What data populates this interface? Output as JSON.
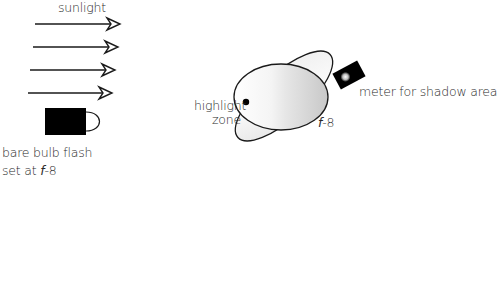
{
  "diagram": {
    "labels": {
      "sunlight": "sunlight",
      "flash_line1": "bare bulb flash",
      "flash_line2_prefix": "set at ",
      "flash_line2_f": "f",
      "flash_line2_value": "-8",
      "highlight_line1": "highlight",
      "highlight_line2": "zone",
      "subject_f": "f",
      "subject_value": "-8",
      "meter": "meter for shadow area"
    },
    "elements": {
      "sunlight_arrows": 4,
      "flash_icon": "flash-unit-icon",
      "subject": "tilted-ellipse-subject",
      "meter_icon": "light-meter-icon"
    },
    "colors": {
      "line": "#1a1a1a",
      "fill_dark": "#000000",
      "shade_light": "#f2f2f2",
      "shade_mid": "#cfcfcf",
      "background": "#ffffff"
    }
  }
}
